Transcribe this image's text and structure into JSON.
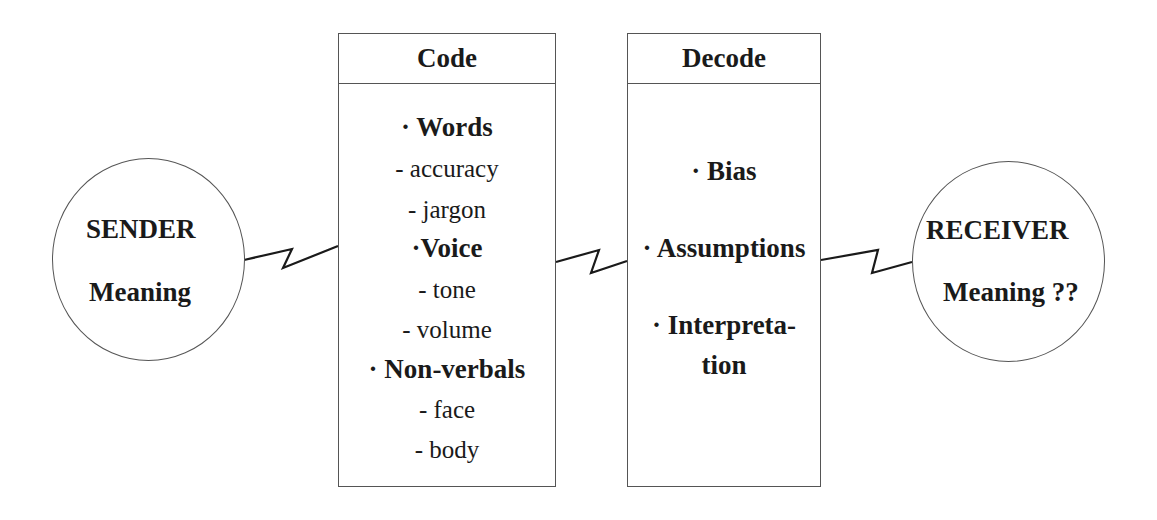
{
  "sender": {
    "title": "SENDER",
    "subtitle": "Meaning"
  },
  "code": {
    "header": "Code",
    "items": [
      {
        "text": "· Words",
        "bold": true
      },
      {
        "text": "- accuracy",
        "bold": false
      },
      {
        "text": "- jargon",
        "bold": false
      },
      {
        "text": "·Voice",
        "bold": true
      },
      {
        "text": "- tone",
        "bold": false
      },
      {
        "text": "- volume",
        "bold": false
      },
      {
        "text": "· Non-verbals",
        "bold": true
      },
      {
        "text": "- face",
        "bold": false
      },
      {
        "text": "- body",
        "bold": false
      }
    ]
  },
  "decode": {
    "header": "Decode",
    "items": [
      {
        "text": "· Bias"
      },
      {
        "text": "· Assumptions"
      },
      {
        "text": "· Interpreta-"
      },
      {
        "text": "tion"
      }
    ]
  },
  "receiver": {
    "title": "RECEIVER",
    "subtitle": "Meaning ??"
  },
  "connectors": [
    "sender-to-code",
    "code-to-decode",
    "decode-to-receiver"
  ],
  "colors": {
    "stroke": "#555555",
    "text": "#1a1a1a",
    "background": "#ffffff"
  }
}
